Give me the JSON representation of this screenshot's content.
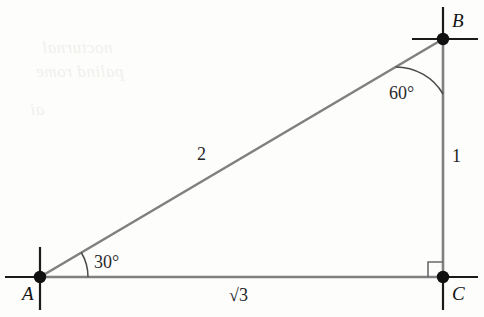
{
  "figure": {
    "type": "right-triangle-30-60-90",
    "background_color": "#fdfdfc",
    "side_stroke_color": "#808080",
    "axis_stroke_color": "#1a1a1a",
    "vertex_dot_color": "#101010",
    "vertices": [
      {
        "name": "A",
        "label": "A",
        "x": 40,
        "y": 277
      },
      {
        "name": "B",
        "label": "B",
        "x": 443,
        "y": 39
      },
      {
        "name": "C",
        "label": "C",
        "x": 443,
        "y": 277
      }
    ],
    "side_labels": {
      "hypotenuse_AB": "2",
      "vertical_BC": "1",
      "base_AC_radical_symbol": "√",
      "base_AC_radicand": "3",
      "base_AC": "√3"
    },
    "angle_labels": {
      "at_A": "30°",
      "at_B": "60°",
      "at_C": "right angle"
    },
    "ghost_text": {
      "line1": "nocturnal",
      "line2": "palind rome",
      "line3": "ai"
    }
  }
}
